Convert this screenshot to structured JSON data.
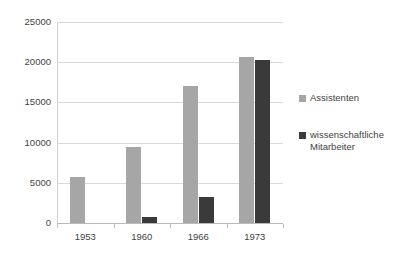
{
  "chart_data": {
    "type": "bar",
    "title": "",
    "subtitle": "",
    "xlabel": "",
    "ylabel": "",
    "categories": [
      "1953",
      "1960",
      "1966",
      "1973"
    ],
    "series": [
      {
        "name": "Assistenten",
        "color": "#a6a6a6",
        "values": [
          5700,
          9500,
          17100,
          20700
        ]
      },
      {
        "name": "wissenschaftliche Mitarbeiter",
        "color": "#3a3a3a",
        "values": [
          0,
          700,
          3200,
          20300
        ]
      }
    ],
    "ylim": [
      0,
      25000
    ],
    "yticks": [
      0,
      5000,
      10000,
      15000,
      20000,
      25000
    ],
    "ytick_labels": [
      "0",
      "5000",
      "10000",
      "15000",
      "20000",
      "25000"
    ],
    "grid": true,
    "legend_position": "right"
  },
  "colors": {
    "series_light": "#a6a6a6",
    "series_dark": "#3a3a3a",
    "gridline": "#d9d9d9",
    "axis": "#b9b9b9",
    "text": "#3f3f3f",
    "background": "#ffffff"
  }
}
